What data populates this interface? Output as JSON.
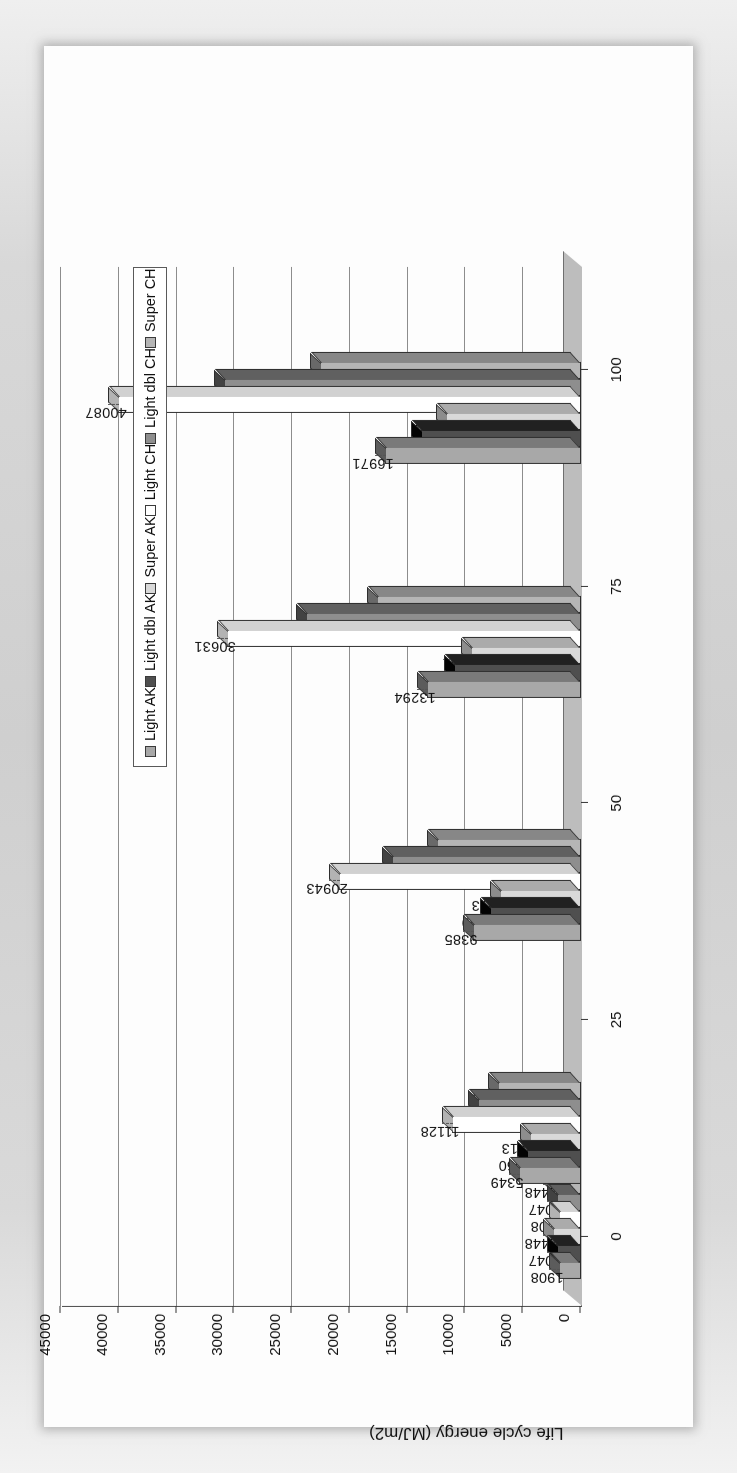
{
  "chart_data": {
    "type": "bar",
    "title": "",
    "xlabel": "Useful life time (years)",
    "ylabel": "Life cycle energy (MJ/m2)",
    "xlim": [
      -8,
      112
    ],
    "ylim": [
      0,
      45000
    ],
    "xticks": [
      0,
      25,
      50,
      75,
      100
    ],
    "yticks": [
      0,
      5000,
      10000,
      15000,
      20000,
      25000,
      30000,
      35000,
      40000,
      45000
    ],
    "ytick_labels": [
      "0",
      "5000",
      "10000",
      "15000",
      "20000",
      "25000",
      "30000",
      "35000",
      "40000",
      "45000"
    ],
    "xtick_labels": [
      "0",
      "25",
      "50",
      "75",
      "100"
    ],
    "grid": "horizontal",
    "legend_position": "bottom",
    "style": "3d-bar",
    "series": [
      {
        "name": "Light AK",
        "color": "#a8a8a8"
      },
      {
        "name": "Light dbl AK",
        "color": "#4f4f4f"
      },
      {
        "name": "Super AK",
        "color": "#d9d9d9"
      },
      {
        "name": "Light CH",
        "color": "#ffffff"
      },
      {
        "name": "Light dbl CH",
        "color": "#8e8e8e"
      },
      {
        "name": "Super CH",
        "color": "#b5b5b5"
      }
    ],
    "groups": [
      {
        "x": 1,
        "values": [
          1908,
          2047,
          2448,
          1908,
          2047,
          2448
        ]
      },
      {
        "x": 12,
        "values": [
          5349,
          4660,
          4413,
          11128,
          8919,
          7147
        ]
      },
      {
        "x": 40,
        "values": [
          9385,
          7869,
          6973,
          20943,
          16386,
          12440
        ]
      },
      {
        "x": 68,
        "values": [
          13294,
          11026,
          9481,
          30631,
          23802,
          17682
        ]
      },
      {
        "x": 95,
        "values": [
          16971,
          13875,
          11681,
          40087,
          30909,
          22615
        ]
      }
    ],
    "data_labels": [
      "1908",
      "2047",
      "2448",
      "1908",
      "2047",
      "2448",
      "5349",
      "4660",
      "4413",
      "11128",
      "8919",
      "7147",
      "9385",
      "7869",
      "6973",
      "20943",
      "16386",
      "12440",
      "13294",
      "11026",
      "9481",
      "30631",
      "23802",
      "17682",
      "16971",
      "13875",
      "11681",
      "40087",
      "30909",
      "22615"
    ]
  },
  "legend": {
    "items": [
      {
        "label": "Light AK",
        "swatch": "#a8a8a8"
      },
      {
        "label": "Light dbl AK",
        "swatch": "#4f4f4f"
      },
      {
        "label": "Super AK",
        "swatch": "#d9d9d9"
      },
      {
        "label": "Light CH",
        "swatch": "#ffffff"
      },
      {
        "label": "Light dbl CH",
        "swatch": "#8e8e8e"
      },
      {
        "label": "Super CH",
        "swatch": "#b5b5b5"
      }
    ]
  }
}
